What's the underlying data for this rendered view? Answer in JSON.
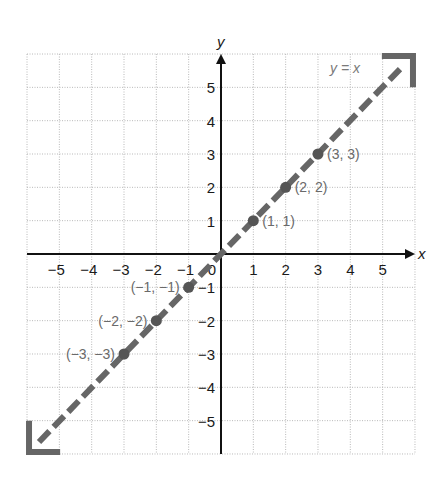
{
  "chart_data": {
    "type": "line",
    "title": "",
    "xlabel": "x",
    "ylabel": "y",
    "xlim": [
      -6,
      6
    ],
    "ylim": [
      -6,
      6
    ],
    "grid": true,
    "x_ticks": [
      -5,
      -4,
      -3,
      -2,
      -1,
      0,
      1,
      2,
      3,
      4,
      5
    ],
    "x_tick_labels": [
      "−5",
      "−4",
      "−3",
      "−2",
      "−1",
      "0",
      "1",
      "2",
      "3",
      "4",
      "5"
    ],
    "y_ticks": [
      5,
      4,
      3,
      2,
      1,
      -1,
      -2,
      -3,
      -4,
      -5
    ],
    "y_tick_labels": [
      "5",
      "4",
      "3",
      "2",
      "1",
      "−1",
      "−2",
      "−3",
      "−4",
      "−5"
    ],
    "series": [
      {
        "name": "y = x",
        "style": "dashed",
        "arrows": "both",
        "color": "#666666",
        "equation": "y = x",
        "x": [
          -6,
          6
        ],
        "y": [
          -6,
          6
        ]
      }
    ],
    "points": [
      {
        "x": 1,
        "y": 1,
        "label": "(1, 1)",
        "label_side": "right"
      },
      {
        "x": 2,
        "y": 2,
        "label": "(2, 2)",
        "label_side": "right"
      },
      {
        "x": 3,
        "y": 3,
        "label": "(3, 3)",
        "label_side": "right"
      },
      {
        "x": -1,
        "y": -1,
        "label": "(−1, −1)",
        "label_side": "left"
      },
      {
        "x": -2,
        "y": -2,
        "label": "(−2, −2)",
        "label_side": "left"
      },
      {
        "x": -3,
        "y": -3,
        "label": "(−3, −3)",
        "label_side": "left"
      }
    ],
    "annotations": [
      {
        "text": "y = x",
        "x": 3.6,
        "y": 5.55
      }
    ]
  },
  "labels": {
    "x_axis": "x",
    "y_axis": "y",
    "line_equation": "y = x"
  },
  "colors": {
    "line": "#666666",
    "point": "#555555",
    "axis": "#111111",
    "grid": "#b8b8b8"
  }
}
